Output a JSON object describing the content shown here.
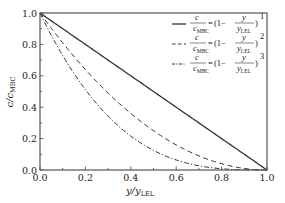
{
  "chart_data": {
    "type": "line",
    "title": "",
    "xlabel": "y/y_LEL",
    "ylabel": "c/c_MBC",
    "xlim": [
      0.0,
      1.0
    ],
    "ylim": [
      0.0,
      1.0
    ],
    "x_ticks": [
      "0.0",
      "0.2",
      "0.4",
      "0.6",
      "0.8",
      "1.0"
    ],
    "y_ticks": [
      "0.0",
      "0.2",
      "0.4",
      "0.6",
      "0.8",
      "1.0"
    ],
    "grid": false,
    "legend_position": "upper right",
    "x": [
      0.0,
      0.1,
      0.2,
      0.3,
      0.4,
      0.5,
      0.6,
      0.7,
      0.8,
      0.9,
      1.0
    ],
    "series": [
      {
        "name": "c/c_MBC = (1 - y/y_LEL)^1",
        "exponent": 1,
        "style": "solid",
        "values": [
          1.0,
          0.9,
          0.8,
          0.7,
          0.6,
          0.5,
          0.4,
          0.3,
          0.2,
          0.1,
          0.0
        ]
      },
      {
        "name": "c/c_MBC = (1 - y/y_LEL)^2",
        "exponent": 2,
        "style": "dashed",
        "values": [
          1.0,
          0.81,
          0.64,
          0.49,
          0.36,
          0.25,
          0.16,
          0.09,
          0.04,
          0.01,
          0.0
        ]
      },
      {
        "name": "c/c_MBC = (1 - y/y_LEL)^3",
        "exponent": 3,
        "style": "dash-dot",
        "values": [
          1.0,
          0.729,
          0.512,
          0.343,
          0.216,
          0.125,
          0.064,
          0.027,
          0.008,
          0.001,
          0.0
        ]
      }
    ]
  },
  "axes": {
    "xlabel_main": "y/y",
    "xlabel_sub": "LEL",
    "ylabel_main": "c/c",
    "ylabel_sub": "MBC"
  },
  "legend": {
    "items": [
      {
        "lhs_num": "c",
        "lhs_den": "c",
        "lhs_den_sub": "MBC",
        "eq": "=",
        "one_minus": "(1−",
        "frac_num": "y",
        "frac_den": "y",
        "frac_den_sub": "LEL",
        "close": ")",
        "exp": "1"
      },
      {
        "lhs_num": "c",
        "lhs_den": "c",
        "lhs_den_sub": "MBC",
        "eq": "=",
        "one_minus": "(1−",
        "frac_num": "y",
        "frac_den": "y",
        "frac_den_sub": "LEL",
        "close": ")",
        "exp": "2"
      },
      {
        "lhs_num": "c",
        "lhs_den": "c",
        "lhs_den_sub": "MBC",
        "eq": "=",
        "one_minus": "(1−",
        "frac_num": "y",
        "frac_den": "y",
        "frac_den_sub": "LEL",
        "close": ")",
        "exp": "3"
      }
    ]
  },
  "colors": {
    "line": "#333333",
    "axis": "#555555",
    "background": "#ffffff"
  }
}
